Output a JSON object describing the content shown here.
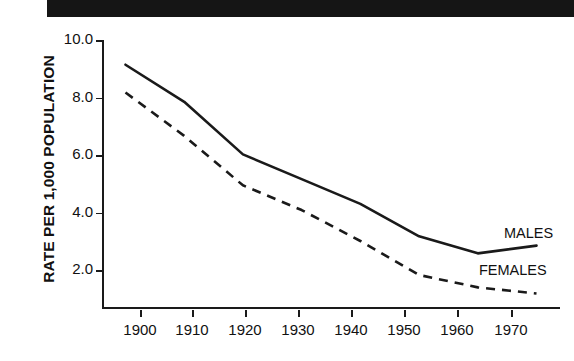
{
  "title": {
    "text": "United States, 1900-1970"
  },
  "axes": {
    "ylabel": "RATE PER 1,000 POPULATION",
    "yticks": [
      "10.0",
      "8.0",
      "6.0",
      "4.0",
      "2.0"
    ],
    "xticks": [
      "1900",
      "1910",
      "1920",
      "1930",
      "1940",
      "1950",
      "1960",
      "1970"
    ]
  },
  "legend": {
    "males": "MALES",
    "females": "FEMALES"
  },
  "colors": {
    "ink": "#1a1a1a",
    "banner": "#151515",
    "banner_text": "#ffffff"
  },
  "chart_data": {
    "type": "line",
    "title": "United States, 1900-1970",
    "xlabel": "",
    "ylabel": "RATE PER 1,000 POPULATION",
    "x": [
      1900,
      1910,
      1920,
      1930,
      1940,
      1950,
      1960,
      1970
    ],
    "xlim": [
      1896,
      1974
    ],
    "ylim": [
      1.3,
      10.0
    ],
    "grid": false,
    "legend_position": "inline-right",
    "series": [
      {
        "name": "MALES",
        "style": "solid",
        "values": [
          9.2,
          8.0,
          6.3,
          5.5,
          4.7,
          3.65,
          3.1,
          3.35
        ]
      },
      {
        "name": "FEMALES",
        "style": "dashed",
        "values": [
          8.3,
          6.9,
          5.3,
          4.5,
          3.5,
          2.4,
          2.0,
          1.8
        ]
      }
    ]
  }
}
